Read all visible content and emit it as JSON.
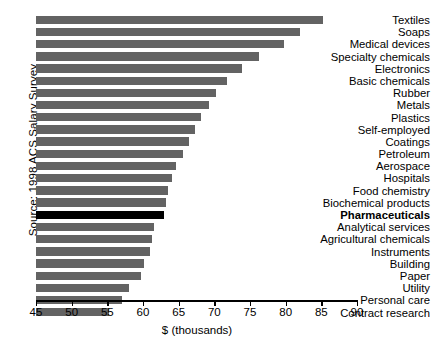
{
  "chart_data": {
    "type": "bar",
    "orientation": "horizontal",
    "title": "",
    "xlabel": "$ (thousands)",
    "ylabel": "Source: 1998 ACS Salary Survey",
    "xlim": [
      45,
      90
    ],
    "xticks": [
      45,
      50,
      55,
      60,
      65,
      70,
      75,
      80,
      85,
      90
    ],
    "xtick_labels": [
      "45",
      "50",
      "55",
      "60",
      "65",
      "70",
      "75",
      "80",
      "85",
      "90"
    ],
    "grid": false,
    "legend": "none",
    "highlight_category": "Pharmaceuticals",
    "colors": {
      "bar": "#636363",
      "highlight_bar": "#000000",
      "background": "#ffffff",
      "axis": "#000000",
      "text": "#000000"
    },
    "categories": [
      "Textiles",
      "Soaps",
      "Medical devices",
      "Specialty chemicals",
      "Electronics",
      "Basic chemicals",
      "Rubber",
      "Metals",
      "Plastics",
      "Self-employed",
      "Coatings",
      "Petroleum",
      "Aerospace",
      "Hospitals",
      "Food chemistry",
      "Biochemical products",
      "Pharmaceuticals",
      "Analytical services",
      "Agricultural chemicals",
      "Instruments",
      "Building",
      "Paper",
      "Utility",
      "Personal care",
      "Contract research"
    ],
    "values": [
      85.2,
      82.0,
      79.7,
      76.3,
      73.9,
      71.8,
      70.3,
      69.2,
      68.2,
      67.3,
      66.4,
      65.6,
      64.6,
      64.0,
      63.5,
      63.2,
      62.9,
      61.6,
      61.3,
      61.0,
      60.2,
      59.7,
      58.0,
      57.0,
      55.2
    ]
  }
}
